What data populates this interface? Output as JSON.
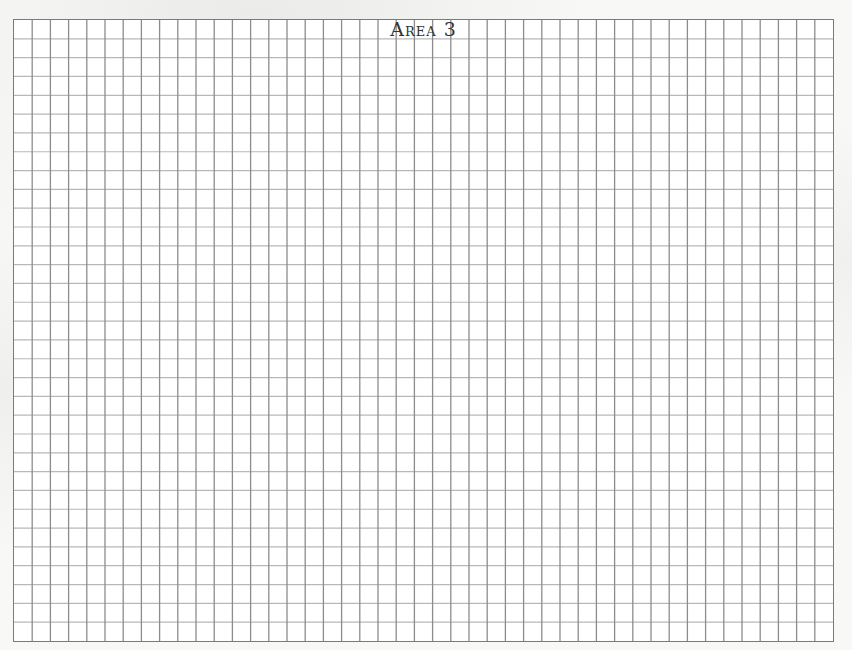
{
  "sheet": {
    "title": "Area 3",
    "grid": {
      "columns": 45,
      "rows": 33,
      "vertical_line_color": "#8c8c8c",
      "horizontal_line_color": "#b8b8b8",
      "border_color": "#7a7a7a"
    }
  }
}
